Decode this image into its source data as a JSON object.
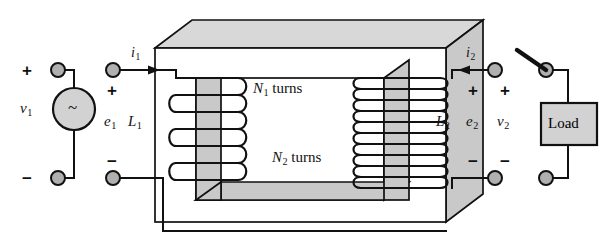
{
  "figure": {
    "kind": "circuit-diagram"
  },
  "colors": {
    "line": "#111111",
    "core_face": "#ffffff",
    "core_shade": "#c9c9c9",
    "core_shade_light": "#d8d8d8",
    "terminal_fill": "#b0b0b0",
    "source_fill": "#d2d2d2",
    "load_fill": "#d2d2d2",
    "background": "#ffffff"
  },
  "primary": {
    "source_symbol": "~",
    "source_label": "v",
    "source_sub": "1",
    "emf_label": "e",
    "emf_sub": "1",
    "inductance_label": "L",
    "inductance_sub": "1",
    "current_label": "i",
    "current_sub": "1",
    "turns_label": "N",
    "turns_sub": "1",
    "turns_word": "turns",
    "plus_source": "+",
    "minus_source": "−",
    "plus_terminal": "+",
    "minus_terminal": "−",
    "coil_turn_count": 7
  },
  "secondary": {
    "emf_label": "e",
    "emf_sub": "2",
    "inductance_label": "L",
    "inductance_sub": "2",
    "voltage_label": "v",
    "voltage_sub": "2",
    "current_label": "i",
    "current_sub": "2",
    "turns_label": "N",
    "turns_sub": "2",
    "turns_word": "turns",
    "plus_emf": "+",
    "minus_emf": "−",
    "plus_load": "+",
    "minus_load": "−",
    "coil_turn_count": 12,
    "load_label": "Load",
    "switch_state": "open"
  }
}
